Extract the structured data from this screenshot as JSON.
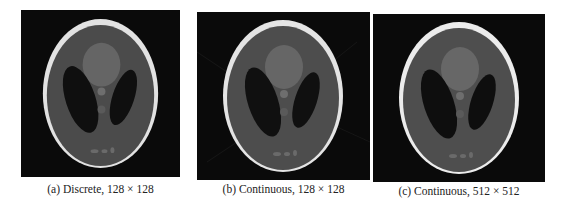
{
  "figure": {
    "panels": [
      {
        "id": "a",
        "caption": "(a) Discrete, 128 × 128",
        "style": "discrete"
      },
      {
        "id": "b",
        "caption": "(b) Continuous, 128 × 128",
        "style": "continuous-low"
      },
      {
        "id": "c",
        "caption": "(c) Continuous, 512 × 512",
        "style": "continuous-high"
      }
    ]
  },
  "colors": {
    "background": "#0a0a0a",
    "skull": "#e6e6e6",
    "brain": "#4c4c4c",
    "dark_ellipses": "#101010",
    "bright_region": "#6a6a6a",
    "small_features": "#777777"
  }
}
